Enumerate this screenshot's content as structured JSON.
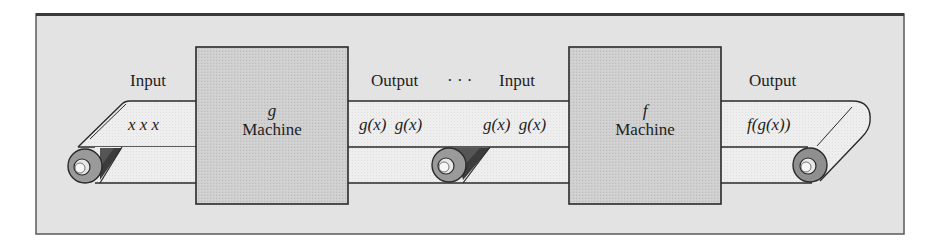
{
  "figure": {
    "colors": {
      "frame_fill": "#e3e3e3",
      "frame_border": "#3a3a3a",
      "machine_fill": "#cdcdcd",
      "belt_fill": "#ececec",
      "roller_outer": "#9a9a9a",
      "roller_shadow": "#555555",
      "line": "#2a2a2a"
    }
  },
  "machines": [
    {
      "function": "g",
      "label": "Machine"
    },
    {
      "function": "f",
      "label": "Machine"
    }
  ],
  "labels": {
    "input_1": "Input",
    "output_1": "Output",
    "ellipsis": "· · ·",
    "input_2": "Input",
    "output_2": "Output"
  },
  "belt_contents": {
    "input_belt": "x  x  x",
    "middle_left": "g(x)  g(x)",
    "middle_right": "g(x)  g(x)",
    "output_belt": "f(g(x))"
  }
}
